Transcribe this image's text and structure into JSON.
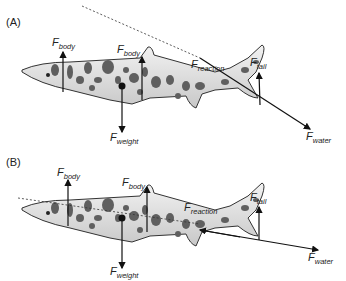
{
  "panels": [
    {
      "label": "(A)",
      "forces": {
        "body_front": {
          "symbol": "F",
          "sub": "body"
        },
        "body_mid": {
          "symbol": "F",
          "sub": "body"
        },
        "weight": {
          "symbol": "F",
          "sub": "weight"
        },
        "reaction": {
          "symbol": "F",
          "sub": "reaction"
        },
        "tail": {
          "symbol": "F",
          "sub": "tail"
        },
        "water": {
          "symbol": "F",
          "sub": "water"
        }
      }
    },
    {
      "label": "(B)",
      "forces": {
        "body_front": {
          "symbol": "F",
          "sub": "body"
        },
        "body_mid": {
          "symbol": "F",
          "sub": "body"
        },
        "weight": {
          "symbol": "F",
          "sub": "weight"
        },
        "reaction": {
          "symbol": "F",
          "sub": "reaction"
        },
        "tail": {
          "symbol": "F",
          "sub": "tail"
        },
        "water": {
          "symbol": "F",
          "sub": "water"
        }
      }
    }
  ],
  "colors": {
    "shark_body": "#e6e6e6",
    "spots": "#5f5f5f",
    "outline": "#333333",
    "arrow": "#111111"
  }
}
